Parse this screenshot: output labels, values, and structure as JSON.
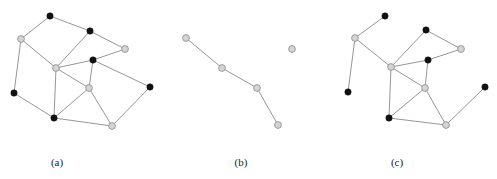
{
  "colors": {
    "black_node": "#111111",
    "grey_node": "#d4d4d4",
    "edge": "#8a8a8a"
  },
  "panels": [
    {
      "label": "(a)",
      "label_pos": [
        57,
        163
      ],
      "nodes": [
        {
          "id": "n1",
          "x": 50,
          "y": 16,
          "color": "black"
        },
        {
          "id": "n2",
          "x": 90,
          "y": 31,
          "color": "black"
        },
        {
          "id": "n3",
          "x": 21,
          "y": 39,
          "color": "grey"
        },
        {
          "id": "n4",
          "x": 125,
          "y": 49,
          "color": "grey"
        },
        {
          "id": "n5",
          "x": 93,
          "y": 60,
          "color": "black"
        },
        {
          "id": "n6",
          "x": 56,
          "y": 68,
          "color": "grey"
        },
        {
          "id": "n7",
          "x": 89,
          "y": 88,
          "color": "grey"
        },
        {
          "id": "n8",
          "x": 150,
          "y": 87,
          "color": "black"
        },
        {
          "id": "n9",
          "x": 14,
          "y": 93,
          "color": "black"
        },
        {
          "id": "n10",
          "x": 54,
          "y": 118,
          "color": "black"
        },
        {
          "id": "n11",
          "x": 112,
          "y": 126,
          "color": "grey"
        }
      ],
      "edges": [
        [
          "n1",
          "n3"
        ],
        [
          "n1",
          "n2"
        ],
        [
          "n2",
          "n4"
        ],
        [
          "n2",
          "n6"
        ],
        [
          "n3",
          "n6"
        ],
        [
          "n3",
          "n9"
        ],
        [
          "n6",
          "n5"
        ],
        [
          "n5",
          "n4"
        ],
        [
          "n5",
          "n8"
        ],
        [
          "n5",
          "n7"
        ],
        [
          "n6",
          "n7"
        ],
        [
          "n6",
          "n10"
        ],
        [
          "n9",
          "n10"
        ],
        [
          "n10",
          "n7"
        ],
        [
          "n10",
          "n11"
        ],
        [
          "n7",
          "n11"
        ],
        [
          "n11",
          "n8"
        ]
      ]
    },
    {
      "label": "(b)",
      "label_pos": [
        241,
        163
      ],
      "nodes": [
        {
          "id": "m1",
          "x": 186,
          "y": 38,
          "color": "grey"
        },
        {
          "id": "m2",
          "x": 222,
          "y": 68,
          "color": "grey"
        },
        {
          "id": "m3",
          "x": 257,
          "y": 88,
          "color": "grey"
        },
        {
          "id": "m4",
          "x": 278,
          "y": 125,
          "color": "grey"
        },
        {
          "id": "m5",
          "x": 292,
          "y": 49,
          "color": "grey"
        }
      ],
      "edges": [
        [
          "m1",
          "m2"
        ],
        [
          "m2",
          "m3"
        ],
        [
          "m3",
          "m4"
        ]
      ]
    },
    {
      "label": "(c)",
      "label_pos": [
        397,
        163
      ],
      "nodes": [
        {
          "id": "c1",
          "x": 385,
          "y": 16,
          "color": "black"
        },
        {
          "id": "c2",
          "x": 426,
          "y": 30,
          "color": "black"
        },
        {
          "id": "c3",
          "x": 355,
          "y": 38,
          "color": "grey"
        },
        {
          "id": "c4",
          "x": 461,
          "y": 49,
          "color": "grey"
        },
        {
          "id": "c5",
          "x": 428,
          "y": 60,
          "color": "black"
        },
        {
          "id": "c6",
          "x": 391,
          "y": 67,
          "color": "grey"
        },
        {
          "id": "c7",
          "x": 425,
          "y": 88,
          "color": "grey"
        },
        {
          "id": "c8",
          "x": 485,
          "y": 87,
          "color": "black"
        },
        {
          "id": "c9",
          "x": 348,
          "y": 92,
          "color": "black"
        },
        {
          "id": "c10",
          "x": 389,
          "y": 118,
          "color": "black"
        },
        {
          "id": "c11",
          "x": 446,
          "y": 125,
          "color": "grey"
        }
      ],
      "edges": [
        [
          "c1",
          "c3"
        ],
        [
          "c3",
          "c9"
        ],
        [
          "c3",
          "c6"
        ],
        [
          "c6",
          "c2"
        ],
        [
          "c2",
          "c4"
        ],
        [
          "c6",
          "c5"
        ],
        [
          "c5",
          "c4"
        ],
        [
          "c5",
          "c7"
        ],
        [
          "c6",
          "c7"
        ],
        [
          "c6",
          "c10"
        ],
        [
          "c10",
          "c7"
        ],
        [
          "c10",
          "c11"
        ],
        [
          "c7",
          "c11"
        ],
        [
          "c11",
          "c8"
        ]
      ]
    }
  ]
}
